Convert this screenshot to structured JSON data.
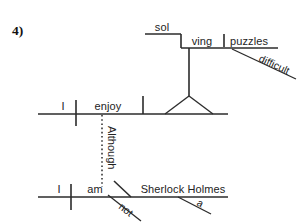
{
  "page": {
    "item_number": "4)",
    "background_color": "#ffffff",
    "ink_color": "#2b2b2b"
  },
  "diagram": {
    "type": "reed-kellogg-sentence-diagram",
    "sentence": "Although I am not Sherlock Holmes, I enjoy solving difficult puzzles.",
    "main_clause": {
      "subject": "I",
      "verb": "enjoy",
      "direct_object_phrase": {
        "gerund_part_1": "sol",
        "gerund_part_2": "ving",
        "gerund_object": "puzzles",
        "gerund_object_modifier": "difficult"
      }
    },
    "subordinate_clause": {
      "conjunction": "Although",
      "subject": "I",
      "verb": "am",
      "verb_modifier": "not",
      "predicate_nominative": "Sherlock Holmes",
      "predicate_nominative_modifier": "a"
    }
  }
}
